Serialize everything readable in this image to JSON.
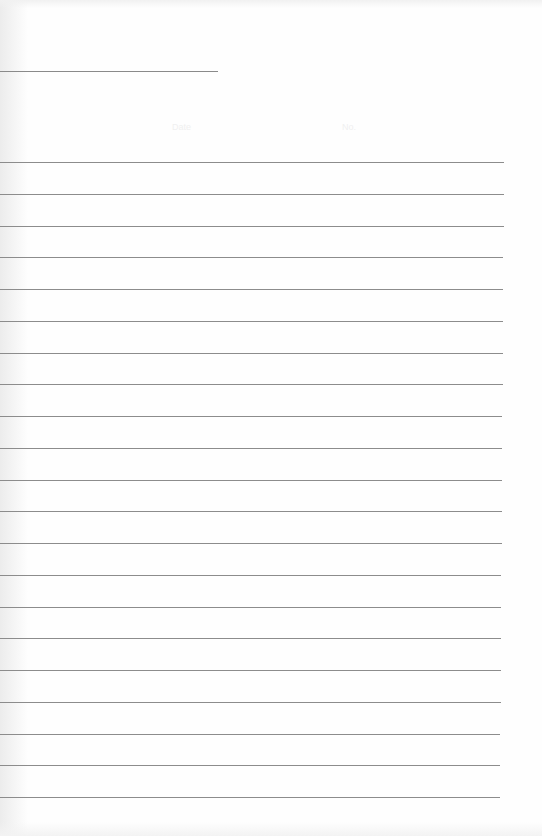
{
  "paper": {
    "type": "lined-notebook-page",
    "header": {
      "date_label": "Date",
      "no_label": "No."
    },
    "rule_color": "#8c8c8c",
    "background_color": "#fefefe",
    "ruled_line_count": 21
  }
}
